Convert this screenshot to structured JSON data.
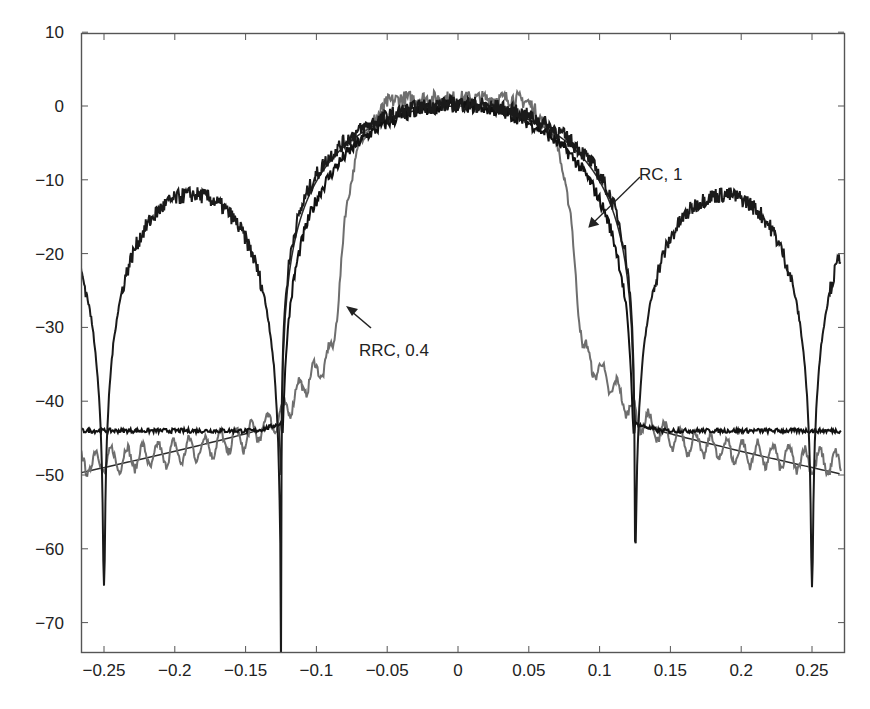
{
  "chart_data": {
    "type": "line",
    "title": "",
    "xlabel": "",
    "ylabel": "",
    "xlim": [
      -0.272,
      0.27
    ],
    "ylim": [
      -74,
      10
    ],
    "grid": false,
    "legend": "none (curves identified by arrow annotations)",
    "x_ticks": [
      -0.25,
      -0.2,
      -0.15,
      -0.1,
      -0.05,
      0,
      0.05,
      0.1,
      0.15,
      0.2,
      0.25
    ],
    "x_tick_labels": [
      "−0.25",
      "−0.2",
      "−0.15",
      "−0.1",
      "−0.05",
      "0",
      "0.05",
      "0.1",
      "0.15",
      "0.2",
      "0.25"
    ],
    "y_ticks": [
      10,
      0,
      -10,
      -20,
      -30,
      -40,
      -50,
      -60,
      -70
    ],
    "y_tick_labels": [
      "10",
      "0",
      "−10",
      "−20",
      "−30",
      "−40",
      "−50",
      "−60",
      "−70"
    ],
    "annotations": [
      {
        "text": "RC, 1",
        "text_xy": [
          0.125,
          -9.5
        ],
        "arrow_to": [
          0.092,
          -16.5
        ]
      },
      {
        "text": "RRC, 0.4",
        "text_xy": [
          -0.071,
          -33.5
        ],
        "arrow_to": [
          -0.078,
          -27
        ]
      }
    ],
    "series": [
      {
        "name": "RC, 1 (measured, noisy)",
        "color": "#1a1a1a",
        "x": [
          -0.272,
          -0.26,
          -0.25,
          -0.24,
          -0.22,
          -0.2,
          -0.175,
          -0.15,
          -0.135,
          -0.125,
          -0.115,
          -0.1,
          -0.075,
          -0.05,
          -0.025,
          0,
          0.025,
          0.05,
          0.075,
          0.1,
          0.115,
          0.125,
          0.135,
          0.15,
          0.175,
          0.2,
          0.22,
          0.24,
          0.25,
          0.26,
          0.27
        ],
        "y": [
          -22,
          -34,
          -65,
          -34,
          -17,
          -13,
          -12,
          -14,
          -24,
          -59,
          -30,
          -15,
          -6,
          -1.5,
          0,
          0,
          0,
          -1.5,
          -6,
          -15,
          -30,
          -59,
          -24,
          -14,
          -12,
          -13,
          -17,
          -34,
          -65,
          -34,
          -22
        ]
      },
      {
        "name": "RRC, 0.4 (measured, noisy)",
        "color": "#6e6e6e",
        "x": [
          -0.272,
          -0.2,
          -0.15,
          -0.125,
          -0.11,
          -0.095,
          -0.088,
          -0.085,
          -0.08,
          -0.07,
          -0.05,
          -0.04,
          0,
          0.04,
          0.05,
          0.07,
          0.08,
          0.085,
          0.088,
          0.095,
          0.11,
          0.125,
          0.15,
          0.2,
          0.27
        ],
        "y": [
          -48.5,
          -47,
          -45,
          -42,
          -38,
          -35,
          -33,
          -28,
          -15,
          -5,
          0.5,
          1,
          1,
          1,
          0.5,
          -5,
          -15,
          -28,
          -33,
          -35,
          -38,
          -42,
          -45,
          -47,
          -48.5
        ]
      },
      {
        "name": "Ideal envelope (smooth)",
        "color": "#2b2b2b",
        "x": [
          -0.272,
          -0.25,
          -0.2,
          -0.15,
          -0.125,
          -0.1,
          -0.075,
          -0.05,
          0,
          0.05,
          0.075,
          0.1,
          0.125,
          0.15,
          0.2,
          0.25,
          0.27
        ],
        "y": [
          -50,
          -49.5,
          -48,
          -46,
          -43,
          -25,
          -8,
          -1,
          0,
          -1,
          -8,
          -25,
          -43,
          -46,
          -48,
          -49.5,
          -50
        ]
      }
    ]
  }
}
